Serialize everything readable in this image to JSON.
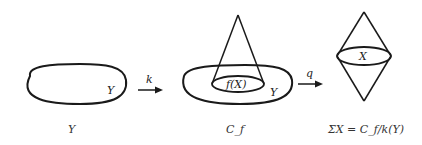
{
  "diagram": {
    "panels": [
      {
        "id": "Y",
        "inner_label": "Y",
        "caption": "Y"
      },
      {
        "id": "Cf",
        "inner_label_blob": "Y",
        "inner_label_disc": "f(X)",
        "caption": "C_f"
      },
      {
        "id": "SigmaX",
        "inner_label": "X",
        "caption": "ΣX = C_f/k(Y)"
      }
    ],
    "arrows": [
      {
        "label": "k",
        "from": "Y",
        "to": "Cf"
      },
      {
        "label": "q",
        "from": "Cf",
        "to": "SigmaX"
      }
    ],
    "stroke_color": "#1a1a1a"
  }
}
